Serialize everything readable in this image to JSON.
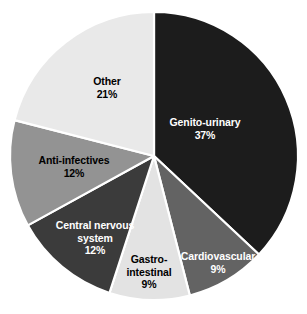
{
  "chart_data": {
    "type": "pie",
    "title": "",
    "xlabel": "",
    "ylabel": "",
    "legend_position": "none",
    "grid": false,
    "start_angle_deg": 0,
    "direction": "clockwise",
    "categories": [
      "Genito-urinary",
      "Cardiovascular",
      "Gastro-intestinal",
      "Central nervous system",
      "Anti-infectives",
      "Other"
    ],
    "values": [
      37,
      9,
      9,
      12,
      12,
      21
    ],
    "value_unit": "%",
    "slices": [
      {
        "label": "Genito-urinary",
        "label_display": "Genito-urinary",
        "value": 37,
        "value_text": "37%",
        "color": "#1c1c1c",
        "text_color": "#ffffff",
        "label_x": 205,
        "label_y": 128
      },
      {
        "label": "Cardiovascular",
        "label_display": "Cardiovascular",
        "value": 9,
        "value_text": "9%",
        "color": "#636363",
        "text_color": "#ffffff",
        "label_x": 218,
        "label_y": 262
      },
      {
        "label": "Gastro-intestinal",
        "label_display": "Gastro-\nintestinal",
        "value": 9,
        "value_text": "9%",
        "color": "#e3e3e3",
        "text_color": "#000000",
        "label_x": 149,
        "label_y": 272
      },
      {
        "label": "Central nervous system",
        "label_display": "Central nervous\nsystem",
        "value": 12,
        "value_text": "12%",
        "color": "#3b3b3b",
        "text_color": "#ffffff",
        "label_x": 95,
        "label_y": 238
      },
      {
        "label": "Anti-infectives",
        "label_display": "Anti-infectives",
        "value": 12,
        "value_text": "12%",
        "color": "#939393",
        "text_color": "#000000",
        "label_x": 74,
        "label_y": 166
      },
      {
        "label": "Other",
        "label_display": "Other",
        "value": 21,
        "value_text": "21%",
        "color": "#e9e9e9",
        "text_color": "#000000",
        "label_x": 107,
        "label_y": 87
      }
    ],
    "geometry": {
      "center_x": 154,
      "center_y": 156,
      "radius": 144,
      "separator_color": "#ffffff",
      "separator_width": 2.2
    },
    "background_color": "#ffffff"
  }
}
